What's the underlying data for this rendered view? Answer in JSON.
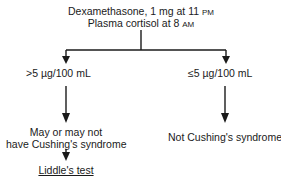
{
  "diagram": {
    "type": "flowchart",
    "root": {
      "line1": "Dexamethasone, 1 mg at 11",
      "line1_unit": "PM",
      "line2": "Plasma cortisol at 8",
      "line2_unit": "AM"
    },
    "branches": [
      {
        "condition": ">5 µg/100 mL",
        "outcome_line1": "May or may not",
        "outcome_line2": "have Cushing's syndrome",
        "next_step": "Liddle's test"
      },
      {
        "condition": "≤5 µg/100 mL",
        "outcome_line1": "Not Cushing's syndrome"
      }
    ]
  }
}
